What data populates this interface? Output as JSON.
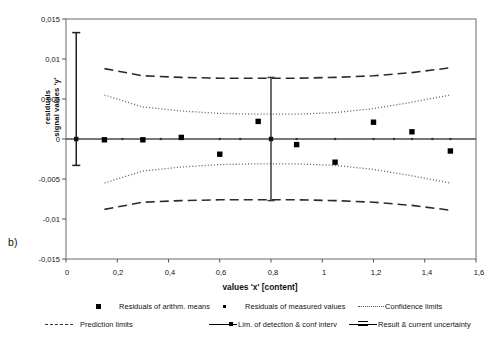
{
  "panel": {
    "label": "b)"
  },
  "chart_data": {
    "type": "scatter",
    "title": "",
    "subtitle": "",
    "xlabel": "values 'x' [content]",
    "ylabel_line1": "residuals",
    "ylabel_line2": "signal values 'y'",
    "xlim": [
      0,
      1.6
    ],
    "ylim": [
      -0.015,
      0.015
    ],
    "xticks": [
      "0",
      "0,2",
      "0,4",
      "0,6",
      "0,8",
      "1",
      "1,2",
      "1,4",
      "1,6"
    ],
    "xtick_values": [
      0,
      0.2,
      0.4,
      0.6,
      0.8,
      1.0,
      1.2,
      1.4,
      1.6
    ],
    "yticks": [
      "0,015",
      "0,01",
      "0,005",
      "0",
      "-0,005",
      "-0,01",
      "-0,015"
    ],
    "ytick_values": [
      0.015,
      0.01,
      0.005,
      0,
      -0.005,
      -0.01,
      -0.015
    ],
    "grid": false,
    "legend_position": "below",
    "series": [
      {
        "name": "Residuals of arithm. means",
        "marker": "square-filled",
        "x": [
          0.15,
          0.3,
          0.45,
          0.6,
          0.75,
          0.9,
          1.05,
          1.2,
          1.35,
          1.5
        ],
        "values": [
          -0.0001,
          -0.0001,
          0.0002,
          -0.0019,
          0.0022,
          -0.0007,
          -0.0029,
          0.0021,
          0.0009,
          -0.0015
        ]
      },
      {
        "name": "Residuals of measured values",
        "marker": "dot-small",
        "x": [
          0.15,
          0.22,
          0.3,
          0.37,
          0.45,
          0.6,
          0.68,
          0.8,
          0.9,
          1.05,
          1.2,
          1.28,
          1.35,
          1.43,
          1.5
        ],
        "values": [
          0,
          0,
          0,
          0,
          0,
          0,
          0,
          0,
          0,
          0,
          0,
          0,
          0,
          0,
          0
        ]
      },
      {
        "name": "Confidence limits",
        "marker": "dotted-line",
        "x": [
          0.15,
          0.3,
          0.45,
          0.6,
          0.75,
          0.8,
          0.9,
          1.05,
          1.2,
          1.35,
          1.5
        ],
        "upper": [
          0.0055,
          0.004,
          0.0035,
          0.0032,
          0.0031,
          0.0031,
          0.0031,
          0.0033,
          0.0038,
          0.0046,
          0.0055
        ],
        "lower": [
          -0.0055,
          -0.004,
          -0.0035,
          -0.0032,
          -0.0031,
          -0.0031,
          -0.0031,
          -0.0033,
          -0.0038,
          -0.0046,
          -0.0055
        ]
      },
      {
        "name": "Prediction limits",
        "marker": "dashed-line",
        "x": [
          0.15,
          0.3,
          0.45,
          0.6,
          0.75,
          0.8,
          0.9,
          1.05,
          1.2,
          1.35,
          1.5
        ],
        "upper": [
          0.0088,
          0.0079,
          0.0077,
          0.0076,
          0.0076,
          0.0076,
          0.0076,
          0.0077,
          0.0079,
          0.0083,
          0.0089
        ],
        "lower": [
          -0.0088,
          -0.0079,
          -0.0077,
          -0.0076,
          -0.0076,
          -0.0076,
          -0.0076,
          -0.0077,
          -0.0079,
          -0.0083,
          -0.0089
        ]
      },
      {
        "name": "Lim. of detection & conf. interv",
        "marker": "vertical-error-bar-with-point",
        "x": [
          0.04
        ],
        "values": [
          0
        ],
        "error_upper": [
          0.0133
        ],
        "error_lower": [
          -0.0033
        ]
      },
      {
        "name": "Result & current uncertainty",
        "marker": "vertical-error-bar",
        "x": [
          0.8
        ],
        "values": [
          0
        ],
        "error_upper": [
          0.0077
        ],
        "error_lower": [
          -0.0077
        ]
      }
    ]
  },
  "legend": {
    "items": [
      {
        "label": "Residuals of arithm. means",
        "style": "square"
      },
      {
        "label": "Residuals of measured values",
        "style": "dot"
      },
      {
        "label": "Confidence limits",
        "style": "dotted"
      },
      {
        "label": "Prediction limits",
        "style": "dashed"
      },
      {
        "label": "Lim. of detection & conf  interv",
        "style": "error-bar"
      },
      {
        "label": "Result & current uncertainty",
        "style": "result"
      }
    ]
  }
}
